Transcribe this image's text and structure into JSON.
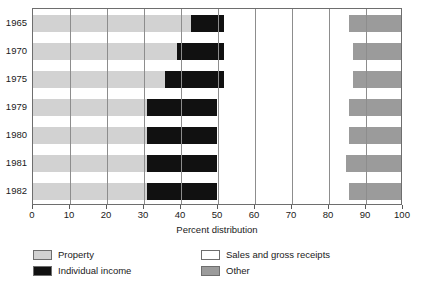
{
  "chart_data": {
    "type": "bar",
    "orientation": "horizontal",
    "stacked": true,
    "title": "",
    "xlabel": "Percent distribution",
    "ylabel": "",
    "xlim": [
      0,
      100
    ],
    "xticks": [
      0,
      10,
      20,
      30,
      40,
      50,
      60,
      70,
      80,
      90,
      100
    ],
    "xtick_labels": [
      "0",
      "10",
      "20",
      "30",
      "40",
      "50",
      "60",
      "70",
      "80",
      "90",
      "100"
    ],
    "grid": true,
    "grid_axis": "x",
    "legend_position": "below",
    "categories": [
      "1965",
      "1970",
      "1975",
      "1979",
      "1980",
      "1981",
      "1982"
    ],
    "series": [
      {
        "name": "Property",
        "color": "#d2d2d2",
        "values": [
          43,
          39,
          36,
          31,
          31,
          31,
          31
        ]
      },
      {
        "name": "Individual income",
        "color": "#111111",
        "values": [
          9,
          13,
          16,
          19,
          19,
          19,
          19
        ]
      },
      {
        "name": "Sales and gross receipts",
        "color": "#ffffff",
        "values": [
          34,
          35,
          35,
          36,
          36,
          35,
          36
        ]
      },
      {
        "name": "Other",
        "color": "#9b9b9b",
        "values": [
          14,
          13,
          13,
          14,
          14,
          15,
          14
        ]
      }
    ]
  },
  "axis": {
    "x_title": "Percent distribution"
  },
  "legend": {
    "items": [
      {
        "label": "Property",
        "swatch": "property"
      },
      {
        "label": "Individual income",
        "swatch": "individual"
      },
      {
        "label": "Sales and gross receipts",
        "swatch": "sales"
      },
      {
        "label": "Other",
        "swatch": "other"
      }
    ]
  },
  "colors": {
    "property": "#d2d2d2",
    "individual_income": "#111111",
    "sales_and_gross_receipts": "#ffffff",
    "other": "#9b9b9b",
    "axis_line": "#6e6e6e",
    "gridline": "#8d8d8d",
    "text": "#1a1a1a",
    "background": "#ffffff"
  }
}
